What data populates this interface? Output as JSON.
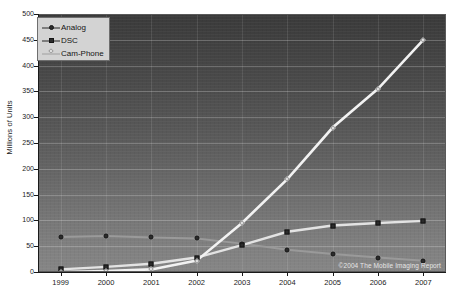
{
  "chart_data": {
    "type": "line",
    "title": "",
    "xlabel": "",
    "ylabel": "Millions of Units",
    "categories": [
      "1999",
      "2000",
      "2001",
      "2002",
      "2003",
      "2004",
      "2005",
      "2006",
      "2007"
    ],
    "ylim": [
      0,
      500
    ],
    "ytick_values": [
      0,
      50,
      100,
      150,
      200,
      250,
      300,
      350,
      400,
      450,
      500
    ],
    "ytick_labels": [
      "0",
      "50",
      "100",
      "150",
      "200",
      "250",
      "300",
      "350",
      "400",
      "450",
      "500"
    ],
    "grid": true,
    "legend_position": "upper-left",
    "series": [
      {
        "name": "Analog",
        "marker": "circle",
        "values": [
          68,
          70,
          67,
          65,
          55,
          43,
          35,
          28,
          22
        ]
      },
      {
        "name": "DSC",
        "marker": "square",
        "values": [
          5,
          10,
          16,
          28,
          52,
          78,
          90,
          95,
          99
        ]
      },
      {
        "name": "Cam-Phone",
        "marker": "diamond",
        "values": [
          0,
          2,
          5,
          22,
          95,
          180,
          280,
          355,
          450
        ]
      }
    ],
    "annotations": [
      "©2004 The Mobile Imaging Report"
    ]
  },
  "legend": {
    "items": [
      {
        "label": "Analog"
      },
      {
        "label": "DSC"
      },
      {
        "label": "Cam-Phone"
      }
    ]
  },
  "credit": "©2004 The Mobile Imaging Report",
  "colors": {
    "analog_line": "#9a9a9a",
    "dsc_line": "#e3e3e3",
    "camphone_line": "#f2f2f2",
    "grid": "#8d8d8d",
    "axis_text": "#1a1a1a",
    "legend_bg": "#d3d3d3"
  }
}
